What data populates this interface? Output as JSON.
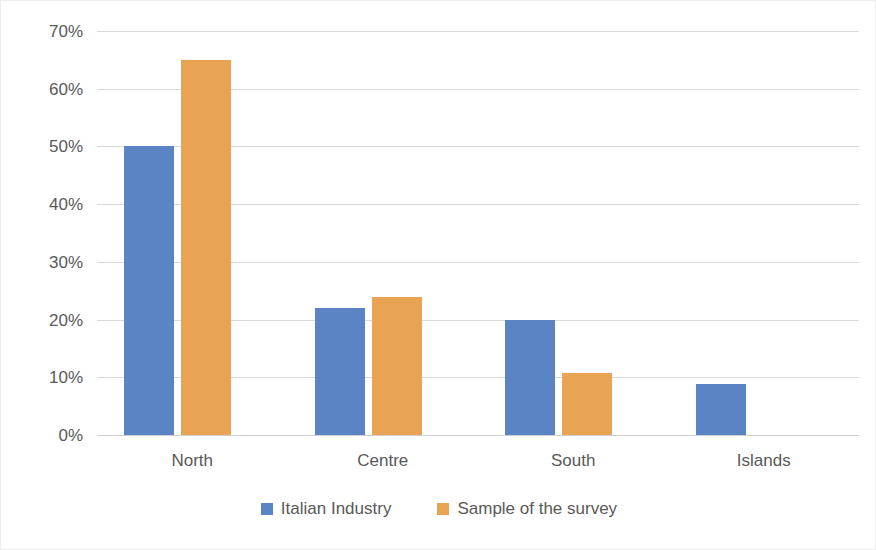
{
  "chart_data": {
    "type": "bar",
    "title": "",
    "subtitle": "",
    "xlabel": "",
    "ylabel": "",
    "categories": [
      "North",
      "Centre",
      "South",
      "Islands"
    ],
    "series": [
      {
        "name": "Italian Industry",
        "color": "#5B84C4",
        "values": [
          50,
          22,
          20,
          8.8
        ]
      },
      {
        "name": "Sample of the survey",
        "color": "#E8A355",
        "values": [
          65,
          24,
          10.8,
          0
        ]
      }
    ],
    "ylim": [
      0,
      70
    ],
    "ytick_values": [
      70,
      60,
      50,
      40,
      30,
      20,
      10,
      0
    ],
    "ytick_labels": [
      "70%",
      "60%",
      "50%",
      "40%",
      "30%",
      "20%",
      "10%",
      "0%"
    ],
    "grid": true,
    "grid_axis": "y",
    "legend_position": "bottom",
    "value_format": "percent"
  },
  "legend": {
    "items": [
      {
        "label": "Italian Industry",
        "color": "#5B84C4",
        "swatch_name": "legend-swatch-italian-industry"
      },
      {
        "label": "Sample of the survey",
        "color": "#E8A355",
        "swatch_name": "legend-swatch-sample-of-the-survey"
      }
    ]
  },
  "colors": {
    "series_1": "#5B84C4",
    "series_2": "#E8A355",
    "gridline": "#d9d9d9",
    "axis_text": "#595959",
    "background": "#ffffff",
    "border": "#ededed"
  }
}
